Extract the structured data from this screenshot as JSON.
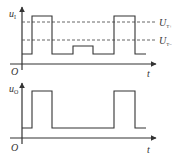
{
  "diagram": {
    "top_plot": {
      "y_label": "u",
      "y_label_sub": "I",
      "x_label": "t",
      "origin_label": "O",
      "threshold_upper": {
        "label": "U",
        "sub": "T+"
      },
      "threshold_lower": {
        "label": "U",
        "sub": "T−"
      }
    },
    "bottom_plot": {
      "y_label": "u",
      "y_label_sub": "O",
      "x_label": "t",
      "origin_label": "O"
    },
    "colors": {
      "line": "#333333",
      "dashed": "#555555"
    }
  }
}
